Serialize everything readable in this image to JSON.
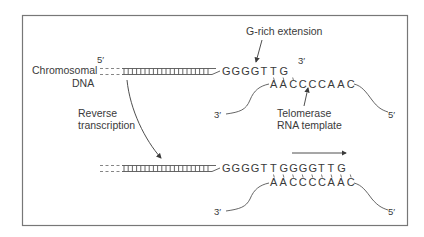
{
  "colors": {
    "ink": "#3a3a3a",
    "frame": "#777777",
    "background": "#ffffff"
  },
  "top": {
    "chromosome_label_line1": "Chromosomal",
    "chromosome_label_line2": "DNA",
    "five_prime": "5′",
    "three_prime_dna": "3′",
    "dna_g_bases": [
      "G",
      "G",
      "G",
      "G",
      "T",
      "T",
      "G"
    ],
    "annotation_extension": "G-rich extension",
    "rna_bases": [
      "A",
      "A",
      "C",
      "C",
      "C",
      "C",
      "A",
      "A",
      "C"
    ],
    "rna_three_prime": "3′",
    "rna_five_prime": "5′",
    "annotation_template_line1": "Telomerase",
    "annotation_template_line2": "RNA template"
  },
  "process_label_line1": "Reverse",
  "process_label_line2": "transcription",
  "bottom": {
    "dna_g_bases": [
      "G",
      "G",
      "G",
      "G",
      "T",
      "T",
      "G",
      "G",
      "G",
      "G",
      "T",
      "T",
      "G"
    ],
    "rna_bases": [
      "A",
      "A",
      "C",
      "C",
      "C",
      "C",
      "A",
      "A",
      "C"
    ],
    "rna_three_prime": "3′",
    "rna_five_prime": "5′",
    "direction_arrow": "right"
  }
}
